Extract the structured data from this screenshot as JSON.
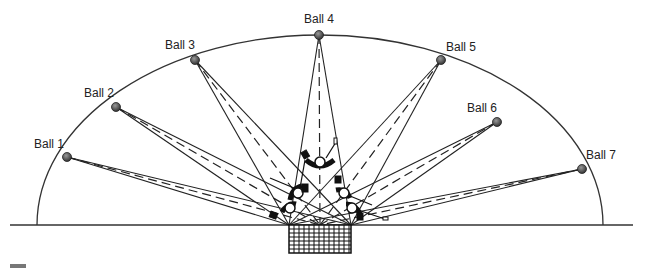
{
  "diagram": {
    "type": "ball-retrieval-drill",
    "balls": [
      {
        "label": "Ball 1",
        "x": 67,
        "y": 157,
        "lx": 34,
        "ly": 148
      },
      {
        "label": "Ball 2",
        "x": 116,
        "y": 107,
        "lx": 84,
        "ly": 97
      },
      {
        "label": "Ball 3",
        "x": 195,
        "y": 60,
        "lx": 165,
        "ly": 49
      },
      {
        "label": "Ball 4",
        "x": 319,
        "y": 35,
        "lx": 304,
        "ly": 23
      },
      {
        "label": "Ball 5",
        "x": 441,
        "y": 60,
        "lx": 446,
        "ly": 51
      },
      {
        "label": "Ball 6",
        "x": 497,
        "y": 122,
        "lx": 467,
        "ly": 112
      },
      {
        "label": "Ball 7",
        "x": 582,
        "y": 169,
        "lx": 586,
        "ly": 159
      }
    ],
    "net": {
      "x": 289,
      "y": 225,
      "width": 62,
      "height": 28
    },
    "ground_y": 225,
    "arc": {
      "cx": 320,
      "cy": 225,
      "rx": 283,
      "ry": 190
    },
    "colors": {
      "line": "#222222",
      "ball": "#555555",
      "arc": "#333333",
      "footer_bar": "#777777"
    }
  }
}
